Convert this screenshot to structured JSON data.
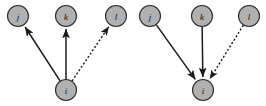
{
  "figure": {
    "title": "",
    "background_color": "#ffffff",
    "width": 266,
    "height": 106,
    "node_fill": "#b0b0b0",
    "node_stroke": "#2b2b2b",
    "edge_color": "#1a1a1a",
    "node_radius": 10.5
  },
  "panels": [
    {
      "id": "left-panel",
      "name": "outgoing-edges-diagram",
      "nodes": [
        {
          "id": "j",
          "label": "j",
          "cx": 18,
          "cy": 16
        },
        {
          "id": "k",
          "label": "k",
          "cx": 66,
          "cy": 16
        },
        {
          "id": "l",
          "label": "l",
          "cx": 116,
          "cy": 16
        },
        {
          "id": "i",
          "label": "i",
          "cx": 66,
          "cy": 90
        }
      ],
      "edges": [
        {
          "from": "i",
          "to": "j",
          "style": "solid",
          "arrow": "to"
        },
        {
          "from": "i",
          "to": "k",
          "style": "solid",
          "arrow": "to"
        },
        {
          "from": "i",
          "to": "l",
          "style": "dotted",
          "arrow": "to"
        }
      ]
    },
    {
      "id": "right-panel",
      "name": "incoming-edges-diagram",
      "nodes": [
        {
          "id": "j",
          "label": "j",
          "cx": 150,
          "cy": 16
        },
        {
          "id": "k",
          "label": "k",
          "cx": 202,
          "cy": 16
        },
        {
          "id": "l",
          "label": "l",
          "cx": 249,
          "cy": 16
        },
        {
          "id": "i",
          "label": "i",
          "cx": 203,
          "cy": 90
        }
      ],
      "edges": [
        {
          "from": "j",
          "to": "i",
          "style": "solid",
          "arrow": "to"
        },
        {
          "from": "k",
          "to": "i",
          "style": "solid",
          "arrow": "to"
        },
        {
          "from": "l",
          "to": "i",
          "style": "dotted",
          "arrow": "to"
        }
      ]
    }
  ]
}
